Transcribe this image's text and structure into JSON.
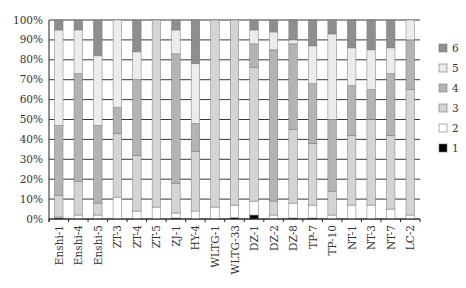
{
  "chart_data": {
    "type": "bar",
    "stacked": true,
    "percent": true,
    "title": "",
    "caption": "",
    "xlabel": "",
    "ylabel": "",
    "ylim": [
      0,
      100
    ],
    "y_ticks": [
      "0%",
      "10%",
      "20%",
      "30%",
      "40%",
      "50%",
      "60%",
      "70%",
      "80%",
      "90%",
      "100%"
    ],
    "grid": true,
    "legend_position": "right",
    "categories": [
      "Enshi-1",
      "Enshi-4",
      "Enshi-5",
      "ZT-3",
      "ZT-4",
      "ZT-5",
      "ZJ-1",
      "HY-4",
      "WLTG-1",
      "WLTG-33",
      "DZ-1",
      "DZ-2",
      "DZ-8",
      "TP-7",
      "TP-10",
      "NT-1",
      "NT-3",
      "NT-7",
      "LC-2"
    ],
    "series": [
      {
        "name": "1",
        "color": "#000000",
        "values": [
          0.5,
          0,
          0,
          0,
          0,
          0,
          0.5,
          0,
          0,
          0.7,
          2,
          0,
          0.5,
          0.5,
          0,
          0,
          0,
          0,
          0
        ]
      },
      {
        "name": "2",
        "color": "#ffffff",
        "values": [
          0.5,
          2,
          2,
          11,
          4,
          6,
          2.5,
          4,
          6,
          6.3,
          7,
          2,
          7.5,
          6.5,
          2,
          7,
          7,
          5,
          2
        ]
      },
      {
        "name": "3",
        "color": "#d4d4d4",
        "values": [
          11,
          17,
          6,
          32,
          28,
          94,
          15,
          30,
          94,
          93,
          67,
          7,
          37,
          31,
          12,
          35,
          43,
          37,
          63
        ]
      },
      {
        "name": "4",
        "color": "#b4b4b4",
        "values": [
          35,
          54,
          39,
          13,
          38,
          0,
          65,
          14,
          0,
          0,
          12,
          76,
          43,
          30,
          36,
          25,
          15,
          31,
          25
        ]
      },
      {
        "name": "5",
        "color": "#ececec",
        "values": [
          48,
          22,
          35,
          44,
          14,
          0,
          12,
          30,
          0,
          0,
          7,
          9,
          2,
          19,
          43,
          19,
          20,
          13,
          10
        ]
      },
      {
        "name": "6",
        "color": "#8e8e8e",
        "values": [
          5,
          5,
          18,
          0,
          16,
          0,
          5,
          22,
          0,
          0,
          5,
          6,
          10,
          13,
          7,
          14,
          15,
          14,
          0
        ]
      }
    ]
  },
  "legend": {
    "items": [
      {
        "label": "6",
        "color": "#8e8e8e"
      },
      {
        "label": "5",
        "color": "#ececec"
      },
      {
        "label": "4",
        "color": "#b4b4b4"
      },
      {
        "label": "3",
        "color": "#d4d4d4"
      },
      {
        "label": "2",
        "color": "#ffffff"
      },
      {
        "label": "1",
        "color": "#000000"
      }
    ]
  }
}
